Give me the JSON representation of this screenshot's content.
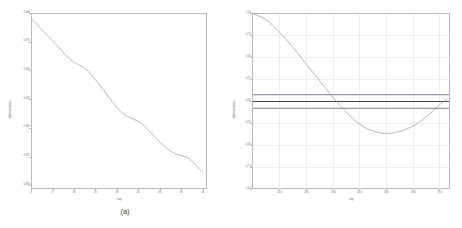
{
  "figure": {
    "panels": [
      {
        "id": "a",
        "caption": "(a)",
        "xlabel": "Lag",
        "ylabel": "Autocorrelation"
      },
      {
        "id": "b",
        "caption": "(b)",
        "xlabel": "Lag",
        "ylabel": "Autocorrelation"
      }
    ]
  },
  "chart_data": [
    {
      "type": "line",
      "panel": "a",
      "title": "",
      "xlabel": "Lag",
      "ylabel": "Autocorrelation",
      "xlim": [
        0,
        41
      ],
      "ylim": [
        0.85,
        1.005
      ],
      "grid": false,
      "legend": "none",
      "xticklabels": [
        "0",
        "5",
        "10",
        "15",
        "20",
        "25",
        "30",
        "35",
        "40"
      ],
      "xticks": [
        0,
        5,
        10,
        15,
        20,
        25,
        30,
        35,
        40
      ],
      "yticklabels": [
        "1.000",
        "0.975",
        "0.950",
        "0.925",
        "0.900",
        "0.875",
        "0.850"
      ],
      "yticks": [
        1.0,
        0.975,
        0.95,
        0.925,
        0.9,
        0.875,
        0.85
      ],
      "x": [
        0,
        1,
        2,
        3,
        4,
        5,
        6,
        7,
        8,
        9,
        10,
        11,
        12,
        13,
        14,
        15,
        16,
        17,
        18,
        19,
        20,
        21,
        22,
        23,
        24,
        25,
        26,
        27,
        28,
        29,
        30,
        31,
        32,
        33,
        34,
        35,
        36,
        37,
        38,
        39,
        40
      ],
      "values": [
        1.0,
        0.9965,
        0.9925,
        0.9885,
        0.9845,
        0.9805,
        0.9765,
        0.9725,
        0.9682,
        0.9645,
        0.9618,
        0.9598,
        0.9578,
        0.9548,
        0.9508,
        0.9462,
        0.9415,
        0.9365,
        0.9315,
        0.9265,
        0.9218,
        0.9178,
        0.9148,
        0.9128,
        0.9112,
        0.9095,
        0.9068,
        0.9032,
        0.8992,
        0.8952,
        0.8912,
        0.8878,
        0.8848,
        0.8822,
        0.8802,
        0.8792,
        0.8782,
        0.8762,
        0.8728,
        0.8688,
        0.8648
      ]
    },
    {
      "type": "line",
      "panel": "b",
      "title": "",
      "xlabel": "Lag",
      "ylabel": "Autocorrelation",
      "xlim": [
        0,
        740
      ],
      "ylim": [
        -1.0,
        1.0
      ],
      "grid": true,
      "legend": "none",
      "xticklabels": [
        "100",
        "200",
        "300",
        "400",
        "500",
        "600",
        "700"
      ],
      "xticks": [
        100,
        200,
        300,
        400,
        500,
        600,
        700
      ],
      "yticklabels": [
        "1.00",
        "0.75",
        "0.50",
        "0.25",
        "0.00",
        "-0.25",
        "-0.50",
        "-0.75",
        "-1.00"
      ],
      "yticks": [
        1.0,
        0.75,
        0.5,
        0.25,
        0.0,
        -0.25,
        -0.5,
        -0.75,
        -1.0
      ],
      "confidence_band_upper": 0.075,
      "confidence_band_lower": -0.075,
      "zero_line": 0.0,
      "x": [
        0,
        50,
        100,
        150,
        200,
        250,
        300,
        350,
        400,
        450,
        500,
        550,
        600,
        650,
        700,
        730
      ],
      "values": [
        1.0,
        0.93,
        0.79,
        0.62,
        0.43,
        0.24,
        0.05,
        -0.12,
        -0.26,
        -0.34,
        -0.37,
        -0.35,
        -0.29,
        -0.19,
        -0.05,
        0.02
      ]
    }
  ]
}
